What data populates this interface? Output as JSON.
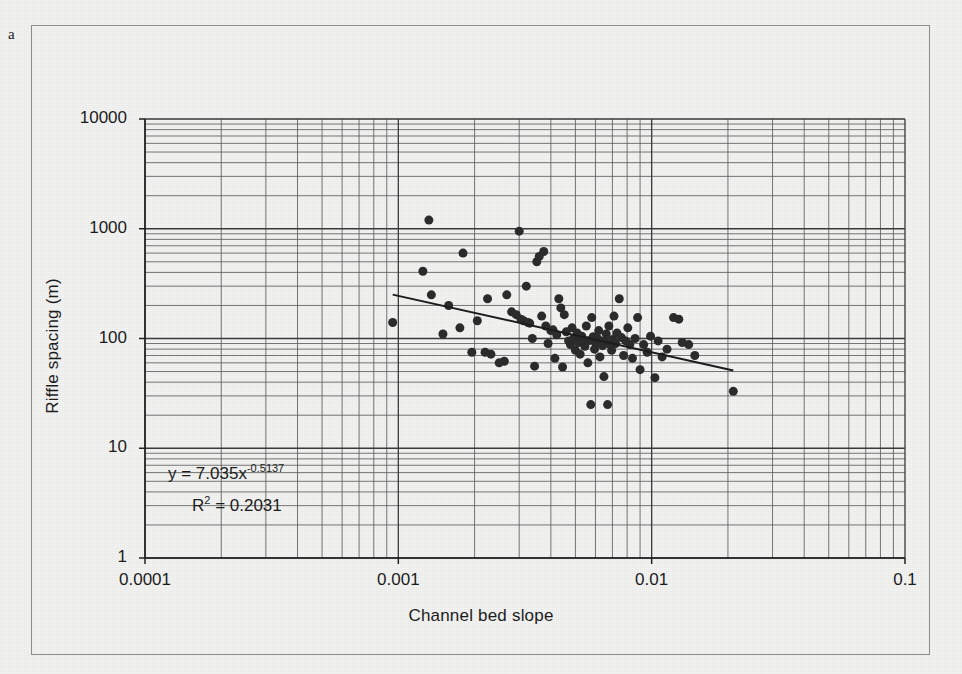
{
  "figure": {
    "panel_label": "a",
    "background_color": "#f4f4f3",
    "frame_color": "#8d8d8d"
  },
  "chart_data": {
    "type": "scatter",
    "title": "",
    "xlabel": "Channel bed slope",
    "ylabel": "Riffle spacing (m)",
    "xscale": "log",
    "yscale": "log",
    "xlim": [
      0.0001,
      0.1
    ],
    "ylim": [
      1,
      10000
    ],
    "grid": true,
    "minor_grid": true,
    "legend": "none",
    "xticks": [
      "0.0001",
      "0.001",
      "0.01",
      "0.1"
    ],
    "yticks": [
      "1",
      "10",
      "100",
      "1000",
      "10000"
    ],
    "marker": {
      "shape": "circle",
      "color": "#2b2b2b",
      "size_px": 9
    },
    "trendline": {
      "type": "power",
      "color": "#1c1c1c",
      "width_px": 2,
      "x_start": 0.00095,
      "x_end": 0.021,
      "coefficient": 7.035,
      "exponent": -0.5137,
      "equation_label": "y = 7.035x",
      "equation_exponent": "-0.5137",
      "r_squared_label": "R",
      "r_squared_sup": "2",
      "r_squared_value": " = 0.2031"
    },
    "points": [
      [
        0.00095,
        140
      ],
      [
        0.00125,
        410
      ],
      [
        0.00132,
        1200
      ],
      [
        0.00135,
        250
      ],
      [
        0.0015,
        110
      ],
      [
        0.00158,
        200
      ],
      [
        0.00175,
        125
      ],
      [
        0.0018,
        600
      ],
      [
        0.00195,
        75
      ],
      [
        0.00205,
        145
      ],
      [
        0.0022,
        75
      ],
      [
        0.00225,
        230
      ],
      [
        0.00232,
        72
      ],
      [
        0.0025,
        60
      ],
      [
        0.00262,
        62
      ],
      [
        0.00268,
        250
      ],
      [
        0.0028,
        175
      ],
      [
        0.00292,
        165
      ],
      [
        0.003,
        950
      ],
      [
        0.00305,
        150
      ],
      [
        0.00312,
        145
      ],
      [
        0.0032,
        300
      ],
      [
        0.00325,
        140
      ],
      [
        0.0033,
        138
      ],
      [
        0.00338,
        100
      ],
      [
        0.00345,
        56
      ],
      [
        0.00352,
        500
      ],
      [
        0.0036,
        560
      ],
      [
        0.00368,
        160
      ],
      [
        0.00375,
        620
      ],
      [
        0.00382,
        130
      ],
      [
        0.0039,
        90
      ],
      [
        0.004,
        118
      ],
      [
        0.00408,
        120
      ],
      [
        0.00415,
        66
      ],
      [
        0.00422,
        108
      ],
      [
        0.0043,
        230
      ],
      [
        0.00438,
        190
      ],
      [
        0.00445,
        55
      ],
      [
        0.00452,
        165
      ],
      [
        0.0046,
        115
      ],
      [
        0.0047,
        95
      ],
      [
        0.00478,
        88
      ],
      [
        0.00485,
        125
      ],
      [
        0.00492,
        100
      ],
      [
        0.005,
        78
      ],
      [
        0.00508,
        112
      ],
      [
        0.00515,
        92
      ],
      [
        0.00522,
        72
      ],
      [
        0.0053,
        105
      ],
      [
        0.00538,
        98
      ],
      [
        0.00545,
        85
      ],
      [
        0.00552,
        130
      ],
      [
        0.0056,
        60
      ],
      [
        0.00568,
        96
      ],
      [
        0.00575,
        25
      ],
      [
        0.0058,
        155
      ],
      [
        0.00588,
        104
      ],
      [
        0.00595,
        80
      ],
      [
        0.00602,
        90
      ],
      [
        0.0061,
        100
      ],
      [
        0.00618,
        118
      ],
      [
        0.00625,
        68
      ],
      [
        0.00632,
        95
      ],
      [
        0.0064,
        86
      ],
      [
        0.00648,
        45
      ],
      [
        0.00655,
        92
      ],
      [
        0.00662,
        110
      ],
      [
        0.0067,
        25
      ],
      [
        0.00678,
        130
      ],
      [
        0.00685,
        88
      ],
      [
        0.00695,
        78
      ],
      [
        0.00702,
        98
      ],
      [
        0.0071,
        160
      ],
      [
        0.0072,
        90
      ],
      [
        0.0073,
        112
      ],
      [
        0.00745,
        230
      ],
      [
        0.0076,
        102
      ],
      [
        0.00775,
        70
      ],
      [
        0.0079,
        95
      ],
      [
        0.00805,
        125
      ],
      [
        0.0082,
        88
      ],
      [
        0.0084,
        66
      ],
      [
        0.0086,
        100
      ],
      [
        0.0088,
        155
      ],
      [
        0.009,
        52
      ],
      [
        0.0093,
        88
      ],
      [
        0.0096,
        75
      ],
      [
        0.0099,
        105
      ],
      [
        0.0103,
        44
      ],
      [
        0.0106,
        95
      ],
      [
        0.011,
        68
      ],
      [
        0.0115,
        80
      ],
      [
        0.0122,
        155
      ],
      [
        0.0128,
        150
      ],
      [
        0.0132,
        92
      ],
      [
        0.014,
        88
      ],
      [
        0.0148,
        70
      ],
      [
        0.021,
        33
      ]
    ]
  }
}
